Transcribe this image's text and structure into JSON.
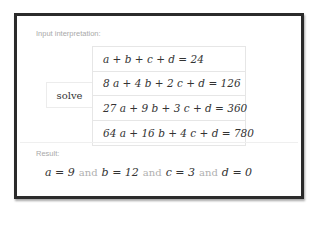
{
  "pod_input": {
    "label": "Input interpretation:",
    "command": "solve",
    "equations": [
      "a + b + c + d = 24",
      "8 a + 4 b + 2 c + d = 126",
      "27 a + 9 b + 3 c + d = 360",
      "64 a + 16 b + 4 c + d = 780"
    ]
  },
  "pod_result": {
    "label": "Result:",
    "solutions": [
      "a = 9",
      "b = 12",
      "c = 3",
      "d = 0"
    ],
    "connector": "and"
  },
  "colors": {
    "frame_border": "#2b2b2b",
    "label_text": "#a9a9a9",
    "math_text": "#333333",
    "connector_text": "#b0b0b0"
  }
}
